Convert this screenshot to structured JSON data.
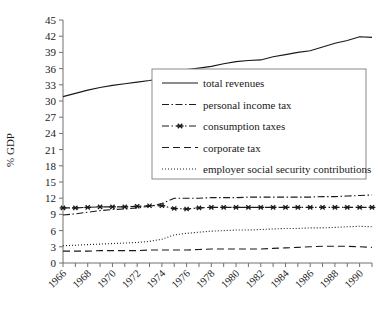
{
  "figure": {
    "ylabel": "% GDP",
    "background": "#ffffff",
    "line_color": "#1a1a1a"
  },
  "chart_data": {
    "type": "line",
    "title": "",
    "xlabel": "",
    "ylabel": "% GDP",
    "ylim": [
      0,
      45
    ],
    "xlim": [
      1966,
      1991
    ],
    "grid": false,
    "legend_position": "center",
    "yticks": [
      0,
      3,
      6,
      9,
      12,
      15,
      18,
      21,
      24,
      27,
      30,
      33,
      36,
      39,
      42,
      45
    ],
    "xticks": [
      1966,
      1967,
      1968,
      1969,
      1970,
      1971,
      1972,
      1973,
      1974,
      1975,
      1976,
      1977,
      1978,
      1979,
      1980,
      1981,
      1982,
      1983,
      1984,
      1985,
      1986,
      1987,
      1988,
      1989,
      1990,
      1991
    ],
    "xticklabels": [
      "1966",
      "1968",
      "1970",
      "1972",
      "1974",
      "1976",
      "1978",
      "1980",
      "1982",
      "1984",
      "1986",
      "1988",
      "1990"
    ],
    "xticklabel_years": [
      1966,
      1968,
      1970,
      1972,
      1974,
      1976,
      1978,
      1980,
      1982,
      1984,
      1986,
      1988,
      1990
    ],
    "x": [
      1966,
      1967,
      1968,
      1969,
      1970,
      1971,
      1972,
      1973,
      1974,
      1975,
      1976,
      1977,
      1978,
      1979,
      1980,
      1981,
      1982,
      1983,
      1984,
      1985,
      1986,
      1987,
      1988,
      1989,
      1990,
      1991
    ],
    "series": [
      {
        "name": "total revenues",
        "style": "solid",
        "marker": "none",
        "values": [
          30.8,
          31.4,
          32.0,
          32.5,
          32.9,
          33.2,
          33.5,
          33.8,
          34.2,
          35.5,
          35.8,
          36.1,
          36.4,
          36.9,
          37.3,
          37.5,
          37.6,
          38.2,
          38.6,
          39.0,
          39.3,
          40.0,
          40.7,
          41.2,
          41.9,
          41.8
        ]
      },
      {
        "name": "personal income tax",
        "style": "dashdot",
        "marker": "none",
        "values": [
          8.9,
          9.1,
          9.4,
          9.7,
          9.9,
          10.0,
          10.2,
          10.5,
          11.0,
          12.0,
          12.0,
          12.0,
          12.1,
          12.1,
          12.1,
          12.2,
          12.2,
          12.2,
          12.2,
          12.2,
          12.2,
          12.3,
          12.3,
          12.4,
          12.5,
          12.6
        ]
      },
      {
        "name": "consumption taxes",
        "style": "dashdot",
        "marker": "star",
        "values": [
          10.2,
          10.2,
          10.3,
          10.4,
          10.4,
          10.4,
          10.5,
          10.6,
          10.6,
          10.1,
          10.0,
          10.2,
          10.3,
          10.3,
          10.3,
          10.3,
          10.3,
          10.3,
          10.3,
          10.3,
          10.3,
          10.3,
          10.3,
          10.3,
          10.3,
          10.3
        ]
      },
      {
        "name": "corporate tax",
        "style": "dashed",
        "marker": "none",
        "values": [
          2.2,
          2.2,
          2.2,
          2.3,
          2.3,
          2.3,
          2.3,
          2.4,
          2.4,
          2.4,
          2.4,
          2.5,
          2.6,
          2.6,
          2.6,
          2.6,
          2.6,
          2.7,
          2.8,
          2.9,
          3.0,
          3.1,
          3.1,
          3.1,
          3.0,
          2.9
        ]
      },
      {
        "name": "employer social security contributions",
        "style": "dotted",
        "marker": "none",
        "values": [
          3.2,
          3.3,
          3.4,
          3.5,
          3.6,
          3.7,
          3.8,
          4.0,
          4.4,
          5.2,
          5.5,
          5.7,
          5.9,
          6.0,
          6.1,
          6.1,
          6.2,
          6.3,
          6.4,
          6.4,
          6.5,
          6.5,
          6.6,
          6.7,
          6.8,
          6.7
        ]
      }
    ]
  },
  "legend": {
    "items": [
      {
        "label": "total revenues",
        "style": "solid"
      },
      {
        "label": "personal income tax",
        "style": "dashdot"
      },
      {
        "label": "consumption taxes",
        "style": "dashdot-star"
      },
      {
        "label": "corporate tax",
        "style": "dashed"
      },
      {
        "label": "employer social security contributions",
        "style": "dotted"
      }
    ]
  }
}
